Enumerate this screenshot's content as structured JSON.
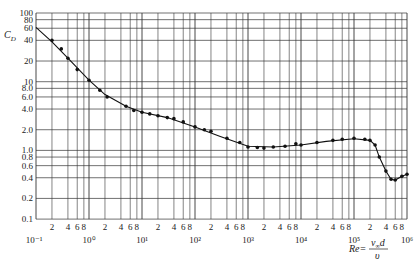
{
  "chart_data": {
    "type": "scatter",
    "title": "",
    "xlabel": "Re = v∞d / ν",
    "ylabel": "C_D",
    "xscale": "log",
    "yscale": "log",
    "xlim": [
      0.1,
      1000000
    ],
    "ylim": [
      0.1,
      100
    ],
    "grid": true,
    "legend": null,
    "x_decade_labels": [
      "10⁻¹",
      "10⁰",
      "10¹",
      "10²",
      "10³",
      "10⁴",
      "10⁵",
      "10⁶"
    ],
    "x_minor_tick_labels": [
      "2",
      "4",
      "6",
      "8"
    ],
    "y_tick_labels": [
      "100",
      "80",
      "60",
      "40",
      "20",
      "10",
      "8.0",
      "6.0",
      "4.0",
      "2.0",
      "1.0",
      "0.8",
      "0.6",
      "0.4",
      "0.2",
      "0.1"
    ],
    "y_tick_values": [
      100,
      80,
      60,
      40,
      20,
      10,
      8,
      6,
      4,
      2,
      1,
      0.8,
      0.6,
      0.4,
      0.2,
      0.1
    ],
    "series": [
      {
        "name": "measured",
        "style": "points",
        "x": [
          0.2,
          0.3,
          0.4,
          0.6,
          1,
          1.6,
          2.2,
          5,
          7,
          10,
          14,
          20,
          30,
          40,
          60,
          100,
          150,
          200,
          400,
          700,
          1000,
          1500,
          2000,
          3000,
          5000,
          8000,
          10000,
          20000,
          40000,
          60000,
          100000,
          160000,
          200000,
          250000,
          300000,
          400000,
          500000,
          600000,
          800000,
          1000000
        ],
        "y": [
          40,
          30,
          22,
          15,
          10.5,
          7.5,
          6,
          4.4,
          3.8,
          3.6,
          3.4,
          3.2,
          3.0,
          2.9,
          2.6,
          2.2,
          2.0,
          1.9,
          1.5,
          1.3,
          1.12,
          1.1,
          1.08,
          1.12,
          1.15,
          1.25,
          1.2,
          1.3,
          1.4,
          1.45,
          1.5,
          1.45,
          1.4,
          1.2,
          0.8,
          0.5,
          0.38,
          0.37,
          0.42,
          0.45
        ]
      },
      {
        "name": "fit curve",
        "style": "line",
        "x": [
          0.1,
          0.2,
          0.4,
          1,
          2,
          5,
          10,
          30,
          100,
          300,
          1000,
          3000,
          10000,
          30000,
          100000,
          200000,
          250000,
          300000,
          400000,
          500000,
          600000,
          800000,
          1000000
        ],
        "y": [
          62,
          38,
          22,
          10.5,
          6.5,
          4.4,
          3.6,
          3.0,
          2.2,
          1.6,
          1.15,
          1.12,
          1.2,
          1.35,
          1.48,
          1.4,
          1.2,
          0.8,
          0.5,
          0.38,
          0.37,
          0.42,
          0.45
        ]
      }
    ]
  },
  "labels": {
    "ylabel_main": "C",
    "ylabel_sub": "D",
    "formula_lhs": "Re=",
    "formula_num": "v",
    "formula_num_sub": "∞",
    "formula_num_tail": "d",
    "formula_den": "υ"
  }
}
